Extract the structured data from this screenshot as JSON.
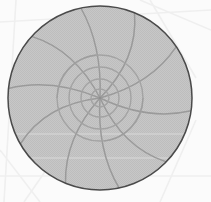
{
  "figure": {
    "width": 211,
    "height": 202,
    "background_color": "#fbfbfb"
  },
  "colors": {
    "page_background": "#fbfbfb",
    "disc_fill": "#c3c3c3",
    "disc_fill_dither_light": "#cfcfcf",
    "disc_fill_dither_dark": "#b7b7b7",
    "disc_outline": "#4a4a4a",
    "web_line": "#9a9a9a",
    "web_line_inner": "#a3a3a3",
    "background_grid_line": "#efefef",
    "band_line": "#d2d2d2"
  },
  "chart_data": {
    "type": "scatter",
    "subtitle": "",
    "xlabel": "",
    "ylabel": "",
    "grid": true,
    "legend": "none",
    "projection": "polar",
    "center": {
      "x": 100,
      "y": 98
    },
    "outer_radius": 92,
    "xlim": [
      8,
      193
    ],
    "ylim": [
      7,
      190
    ],
    "rings": [
      {
        "label": "r1",
        "radius": 9
      },
      {
        "label": "r2",
        "radius": 19
      },
      {
        "label": "r3",
        "radius": 31
      },
      {
        "label": "r4",
        "radius": 43
      },
      {
        "label": "outer",
        "radius": 92
      }
    ],
    "spokes": [
      {
        "label": "s0",
        "angle_deg": 8,
        "curve": 16
      },
      {
        "label": "s1",
        "angle_deg": 44,
        "curve": 20
      },
      {
        "label": "s2",
        "angle_deg": 78,
        "curve": 14
      },
      {
        "label": "s3",
        "angle_deg": 112,
        "curve": 18
      },
      {
        "label": "s4",
        "angle_deg": 150,
        "curve": 22
      },
      {
        "label": "s5",
        "angle_deg": 186,
        "curve": 15
      },
      {
        "label": "s6",
        "angle_deg": 222,
        "curve": 19
      },
      {
        "label": "s7",
        "angle_deg": 258,
        "curve": 13
      },
      {
        "label": "s8",
        "angle_deg": 292,
        "curve": 21
      },
      {
        "label": "s9",
        "angle_deg": 326,
        "curve": 17
      }
    ],
    "horizontal_bands": [
      {
        "label": "band1",
        "y": 134
      },
      {
        "label": "band2",
        "y": 158
      }
    ],
    "background_grid": [
      {
        "label": "bg1",
        "x1": 0,
        "y1": 22,
        "x2": 211,
        "y2": 10
      },
      {
        "label": "bg2",
        "x1": 16,
        "y1": 0,
        "x2": 4,
        "y2": 202
      },
      {
        "label": "bg3",
        "x1": 150,
        "y1": 0,
        "x2": 196,
        "y2": 78
      },
      {
        "label": "bg4",
        "x1": 211,
        "y1": 30,
        "x2": 140,
        "y2": 0
      },
      {
        "label": "bg5",
        "x1": 0,
        "y1": 176,
        "x2": 211,
        "y2": 176
      },
      {
        "label": "bg6",
        "x1": 196,
        "y1": 120,
        "x2": 160,
        "y2": 202
      },
      {
        "label": "bg7",
        "x1": 24,
        "y1": 202,
        "x2": 60,
        "y2": 150
      },
      {
        "label": "bg8",
        "x1": 0,
        "y1": 150,
        "x2": 40,
        "y2": 202
      }
    ]
  }
}
